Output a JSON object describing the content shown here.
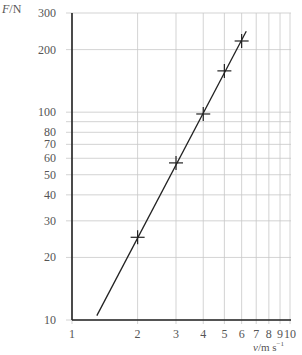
{
  "chart_data": {
    "type": "line",
    "title": "",
    "xlabel": "v/m s⁻¹",
    "ylabel": "F/N",
    "xscale": "log",
    "yscale": "log",
    "xlim": [
      1,
      10
    ],
    "ylim": [
      10,
      300
    ],
    "grid": true,
    "x_ticks": [
      1,
      2,
      3,
      4,
      5,
      6,
      7,
      8,
      9,
      10
    ],
    "x_tick_labels": [
      "1",
      "2",
      "3",
      "4",
      "5",
      "6",
      "7",
      "8",
      "9",
      "10"
    ],
    "y_ticks": [
      10,
      20,
      30,
      40,
      50,
      60,
      70,
      80,
      90,
      100,
      200,
      300
    ],
    "y_tick_labels": [
      "10",
      "20",
      "30",
      "40",
      "50",
      "60",
      "70",
      "80",
      "",
      "100",
      "200",
      "300"
    ],
    "series": [
      {
        "name": "measured points",
        "marker": "+",
        "x": [
          2,
          3,
          4,
          5,
          6
        ],
        "y": [
          25,
          57,
          98,
          158,
          220
        ]
      },
      {
        "name": "best-fit line",
        "marker": "none",
        "x": [
          1.3,
          6.3
        ],
        "y": [
          10.5,
          245
        ]
      }
    ],
    "colors": {
      "grid": "#c8c8c8",
      "axis": "#222222",
      "line": "#222222",
      "text": "#555555"
    }
  },
  "labels": {
    "y_axis_title_italic": "F",
    "y_axis_title_unit": "/N",
    "x_axis_title_italic": "v",
    "x_axis_title_unit": "/m s",
    "x_axis_title_exp": "−1"
  }
}
